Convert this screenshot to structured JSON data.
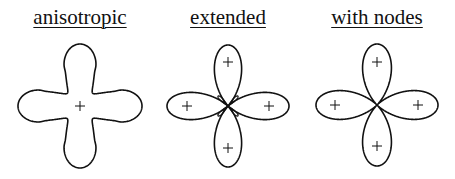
{
  "diagram": {
    "panels": [
      {
        "id": "anisotropic",
        "title": "anisotropic",
        "cx": 80,
        "cy": 106,
        "signs": [
          {
            "x": 80,
            "y": 106,
            "label": "+"
          }
        ]
      },
      {
        "id": "extended",
        "title": "extended",
        "cx": 228,
        "cy": 106,
        "signs": [
          {
            "x": 228,
            "y": 62,
            "label": "+"
          },
          {
            "x": 187,
            "y": 106,
            "label": "+"
          },
          {
            "x": 269,
            "y": 106,
            "label": "+"
          },
          {
            "x": 228,
            "y": 148,
            "label": "+"
          }
        ]
      },
      {
        "id": "with-nodes",
        "title": "with nodes",
        "cx": 377,
        "cy": 105,
        "signs": [
          {
            "x": 377,
            "y": 62,
            "label": "+"
          },
          {
            "x": 335,
            "y": 105,
            "label": "+"
          },
          {
            "x": 418,
            "y": 105,
            "label": "+"
          },
          {
            "x": 377,
            "y": 146,
            "label": "+"
          }
        ]
      }
    ],
    "line_color": "#111111",
    "background": "#ffffff"
  }
}
